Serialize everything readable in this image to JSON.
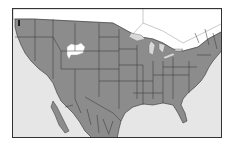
{
  "map": {
    "type": "range-map",
    "region": "North America (United States, southern Canada, northern Mexico)",
    "colors": {
      "range": "#8c8c8c",
      "ocean": "#e6e6e6",
      "non_range_land": "#ffffff",
      "great_lakes": "#d8d8d8",
      "borders": "#333333",
      "frame": "#333333"
    },
    "legend": {
      "range_label": "Range",
      "gap_label": "Excluded area"
    },
    "features": {
      "range_extent": "Contiguous United States, northern Mexico, southern Canadian border strip",
      "gap": "Small unoccupied patch in Wyoming",
      "north_limit": "Southern Canada",
      "south_limit": "Central Mexico"
    }
  }
}
